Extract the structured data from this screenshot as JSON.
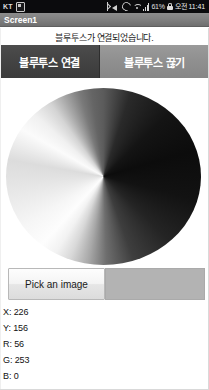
{
  "status_bar": {
    "carrier": "KT",
    "sim_icon": "sim-card-icon",
    "icons": [
      "bluetooth-icon",
      "volume-mute-icon",
      "sync-icon",
      "wifi-icon",
      "signal-bars-icon"
    ],
    "battery_percent": "61%",
    "lock_icon": "screen-lock-icon",
    "clock": "오전 11:41"
  },
  "title_bar": {
    "title": "Screen1"
  },
  "main": {
    "status_message": "블루투스가 연결되었습니다.",
    "buttons": {
      "connect_label": "블루투스 연결",
      "disconnect_label": "블루투스 끊기"
    },
    "color_wheel": {
      "name": "grayscale-color-wheel",
      "shape": "circle"
    },
    "pick_image_label": "Pick an image",
    "image_preview": {
      "name": "image-preview",
      "fill_color": "#b3b3b3"
    },
    "readout": [
      "X: 226",
      "Y: 156",
      "R: 56",
      "G: 253",
      "B: 0"
    ]
  },
  "colors": {
    "title_bar_bg": "#7e7e7e",
    "connect_button_bg": "#434343",
    "disconnect_button_bg": "#8f8f8f",
    "status_bar_bg": "#0b0b0d",
    "preview_bg": "#b3b3b3"
  }
}
